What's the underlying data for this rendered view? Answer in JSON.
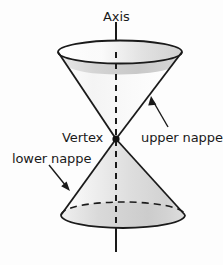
{
  "figure": {
    "background_color": "#fdfdfd",
    "stroke_color": "#1a1a1a",
    "labels": {
      "axis": "Axis",
      "vertex": "Vertex",
      "upper_nappe": "upper nappe",
      "lower_nappe": "lower nappe"
    },
    "geometry": {
      "vertex_point": {
        "x": 116,
        "y": 139
      },
      "axis_line": {
        "x": 116,
        "y_top": 22,
        "y_bottom": 252
      },
      "axis_solid_segments": [
        [
          22,
          52
        ],
        [
          228,
          252
        ]
      ],
      "axis_dashed_segments": [
        [
          52,
          228
        ]
      ],
      "top_ellipse": {
        "cx": 120,
        "cy": 52,
        "rx": 62,
        "ry": 11.5,
        "upper_arc": "solid",
        "lower_arc": "solid"
      },
      "bottom_ellipse": {
        "cx": 123,
        "cy": 215,
        "rx": 62,
        "ry": 13,
        "upper_arc": "dashed",
        "lower_arc": "solid"
      }
    },
    "annotations": [
      {
        "name": "upper-nappe-arrow",
        "from": {
          "x": 168,
          "y": 127
        },
        "to": {
          "x": 152,
          "y": 100
        }
      },
      {
        "name": "lower-nappe-arrow",
        "from": {
          "x": 50,
          "y": 165
        },
        "to": {
          "x": 70,
          "y": 190
        }
      }
    ],
    "colors": {
      "shade_light": "#fbfbfb",
      "shade_mid": "#d8d8d8",
      "shade_dark": "#b4b4b4",
      "outline": "#1a1a1a"
    }
  }
}
